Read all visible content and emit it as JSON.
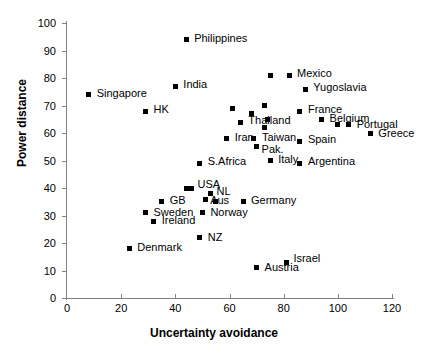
{
  "chart_data": {
    "type": "scatter",
    "title": "",
    "xlabel": "Uncertainty avoidance",
    "ylabel": "Power distance",
    "xlim": [
      0,
      120
    ],
    "ylim": [
      0,
      100
    ],
    "xticks": [
      0,
      20,
      40,
      60,
      80,
      100,
      120
    ],
    "yticks": [
      0,
      10,
      20,
      30,
      40,
      50,
      60,
      70,
      80,
      90,
      100
    ],
    "grid": false,
    "legend": false,
    "marker": "square",
    "marker_color": "#000000",
    "points": [
      {
        "label": "Singapore",
        "x": 8,
        "y": 74,
        "lx": 8,
        "ly": -4
      },
      {
        "label": "Philippines",
        "x": 44,
        "y": 94,
        "lx": 8,
        "ly": -4
      },
      {
        "label": "India",
        "x": 40,
        "y": 77,
        "lx": 8,
        "ly": -4
      },
      {
        "label": "HK",
        "x": 29,
        "y": 68,
        "lx": 8,
        "ly": -4
      },
      {
        "label": "Mexico",
        "x": 82,
        "y": 81,
        "lx": 8,
        "ly": -4
      },
      {
        "label": "",
        "x": 75,
        "y": 81,
        "lx": 0,
        "ly": 0
      },
      {
        "label": "Yugoslavia",
        "x": 88,
        "y": 76,
        "lx": 8,
        "ly": -4
      },
      {
        "label": "Thailand",
        "x": 64,
        "y": 64,
        "lx": 8,
        "ly": -4
      },
      {
        "label": "",
        "x": 61,
        "y": 69,
        "lx": 0,
        "ly": 0
      },
      {
        "label": "",
        "x": 68,
        "y": 67,
        "lx": 0,
        "ly": 0
      },
      {
        "label": "France",
        "x": 86,
        "y": 68,
        "lx": 8,
        "ly": -4
      },
      {
        "label": "",
        "x": 73,
        "y": 70,
        "lx": 0,
        "ly": 0
      },
      {
        "label": "",
        "x": 74,
        "y": 65,
        "lx": 0,
        "ly": 0
      },
      {
        "label": "",
        "x": 73,
        "y": 62,
        "lx": 0,
        "ly": 0
      },
      {
        "label": "Belgium",
        "x": 94,
        "y": 65,
        "lx": 8,
        "ly": -3
      },
      {
        "label": "",
        "x": 100,
        "y": 63,
        "lx": 0,
        "ly": 0
      },
      {
        "label": "Portugal",
        "x": 104,
        "y": 63,
        "lx": 8,
        "ly": -3
      },
      {
        "label": "Greece",
        "x": 112,
        "y": 60,
        "lx": 8,
        "ly": -2
      },
      {
        "label": "Iran",
        "x": 59,
        "y": 58,
        "lx": 8,
        "ly": -4
      },
      {
        "label": "Taiwan",
        "x": 69,
        "y": 58,
        "lx": 8,
        "ly": -4
      },
      {
        "label": "Pak.",
        "x": 70,
        "y": 55,
        "lx": 5,
        "ly": 0
      },
      {
        "label": "Spain",
        "x": 86,
        "y": 57,
        "lx": 8,
        "ly": -4
      },
      {
        "label": "S.Africa",
        "x": 49,
        "y": 49,
        "lx": 8,
        "ly": -4
      },
      {
        "label": "Italy",
        "x": 75,
        "y": 50,
        "lx": 8,
        "ly": -4
      },
      {
        "label": "Argentina",
        "x": 86,
        "y": 49,
        "lx": 8,
        "ly": -4
      },
      {
        "label": "USA",
        "x": 46,
        "y": 40,
        "lx": 6,
        "ly": -6
      },
      {
        "label": "",
        "x": 44,
        "y": 40,
        "lx": 0,
        "ly": 0
      },
      {
        "label": "NL",
        "x": 53,
        "y": 38,
        "lx": 6,
        "ly": -5
      },
      {
        "label": "Aus",
        "x": 51,
        "y": 36,
        "lx": 5,
        "ly": -1
      },
      {
        "label": "GB",
        "x": 35,
        "y": 35,
        "lx": 8,
        "ly": -4
      },
      {
        "label": "",
        "x": 55,
        "y": 35,
        "lx": 0,
        "ly": 0
      },
      {
        "label": "Germany",
        "x": 65,
        "y": 35,
        "lx": 8,
        "ly": -4
      },
      {
        "label": "Sweden",
        "x": 29,
        "y": 31,
        "lx": 8,
        "ly": -3
      },
      {
        "label": "Norway",
        "x": 50,
        "y": 31,
        "lx": 8,
        "ly": -3
      },
      {
        "label": "Ireland",
        "x": 32,
        "y": 28,
        "lx": 8,
        "ly": -3
      },
      {
        "label": "NZ",
        "x": 49,
        "y": 22,
        "lx": 8,
        "ly": -3
      },
      {
        "label": "Denmark",
        "x": 23,
        "y": 18,
        "lx": 8,
        "ly": -4
      },
      {
        "label": "Austria",
        "x": 70,
        "y": 11,
        "lx": 8,
        "ly": -3
      },
      {
        "label": "Israel",
        "x": 81,
        "y": 13,
        "lx": 7,
        "ly": -6
      }
    ]
  }
}
